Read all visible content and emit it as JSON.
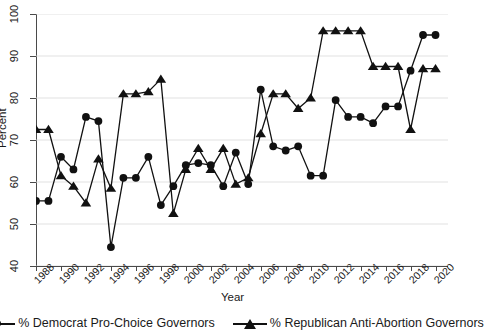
{
  "chart_data": {
    "type": "line",
    "title": "",
    "subtitle": "",
    "xlabel": "Year",
    "ylabel": "Percent",
    "xlim": [
      1988,
      2021
    ],
    "ylim": [
      40,
      100
    ],
    "ytick_labels": [
      "40",
      "50",
      "60",
      "70",
      "80",
      "90",
      "100"
    ],
    "ytick_values": [
      40,
      50,
      60,
      70,
      80,
      90,
      100
    ],
    "xtick_labels": [
      "1988",
      "1990",
      "1992",
      "1994",
      "1996",
      "1998",
      "2000",
      "2002",
      "2004",
      "2006",
      "2008",
      "2010",
      "2012",
      "2014",
      "2016",
      "2018",
      "2020"
    ],
    "xtick_values": [
      1988,
      1990,
      1992,
      1994,
      1996,
      1998,
      2000,
      2002,
      2004,
      2006,
      2008,
      2010,
      2012,
      2014,
      2016,
      2018,
      2020
    ],
    "grid": true,
    "grid_axis": "y",
    "legend_position": "bottom",
    "x": [
      1988,
      1989,
      1990,
      1991,
      1992,
      1993,
      1994,
      1995,
      1996,
      1997,
      1998,
      1999,
      2000,
      2001,
      2002,
      2003,
      2004,
      2005,
      2006,
      2007,
      2008,
      2009,
      2010,
      2011,
      2012,
      2013,
      2014,
      2015,
      2016,
      2017,
      2018,
      2019,
      2020
    ],
    "series": [
      {
        "name": "% Democrat Pro-Choice Governors",
        "marker": "circle",
        "color": "#111111",
        "values": [
          55.5,
          55.5,
          66,
          63,
          75.5,
          74.5,
          44.5,
          61,
          61,
          66,
          54.5,
          59,
          64,
          64.5,
          64,
          59,
          67,
          59.5,
          82,
          68.5,
          67.5,
          68.5,
          61.5,
          61.5,
          79.5,
          75.5,
          75.5,
          74,
          78,
          78,
          86.5,
          95,
          95
        ]
      },
      {
        "name": "% Republican Anti-Abortion Governors",
        "marker": "triangle",
        "color": "#111111",
        "values": [
          72.5,
          72.5,
          61.5,
          59,
          55,
          65.5,
          58.5,
          81,
          81,
          81.5,
          84.5,
          52.5,
          63,
          68,
          63,
          68,
          59.5,
          61,
          71.5,
          81,
          81,
          77.5,
          80,
          96,
          96,
          96,
          96,
          87.5,
          87.5,
          87.5,
          72.5,
          87,
          87
        ]
      }
    ]
  },
  "legend": {
    "items": [
      {
        "label": "% Democrat Pro-Choice Governors",
        "marker": "circle"
      },
      {
        "label": "% Republican Anti-Abortion Governors",
        "marker": "triangle"
      }
    ]
  }
}
